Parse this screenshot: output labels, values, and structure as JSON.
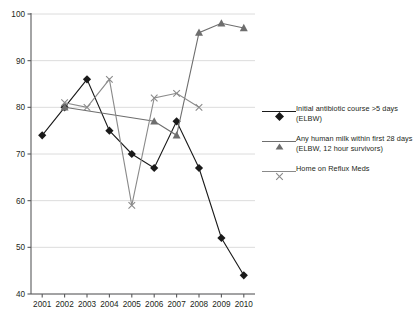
{
  "chart_data": {
    "type": "line",
    "title": "",
    "xlabel": "",
    "ylabel": "",
    "x": [
      2001,
      2002,
      2003,
      2004,
      2005,
      2006,
      2007,
      2008,
      2009,
      2010
    ],
    "xtick_labels": [
      "2001",
      "2002",
      "2003",
      "2004",
      "2005",
      "2006",
      "2007",
      "2008",
      "2009",
      "2010"
    ],
    "xlim": [
      2000.5,
      2010.5
    ],
    "ylim": [
      40,
      100
    ],
    "ytick_labels": [
      "40",
      "50",
      "60",
      "70",
      "80",
      "90",
      "100"
    ],
    "yticks": [
      40,
      50,
      60,
      70,
      80,
      90,
      100
    ],
    "grid": "horizontal",
    "legend_position": "right",
    "series": [
      {
        "name": "Initial antibiotic course >5 days (ELBW)",
        "marker": "diamond",
        "color": "#1a1a1a",
        "x": [
          2001,
          2002,
          2003,
          2004,
          2005,
          2006,
          2007,
          2008,
          2009,
          2010
        ],
        "values": [
          74,
          80,
          86,
          75,
          70,
          67,
          77,
          67,
          52,
          44
        ]
      },
      {
        "name": "Any human milk within first 28 days (ELBW, 12 hour survivors)",
        "marker": "triangle",
        "color": "#6e6e6e",
        "x": [
          2002,
          2006,
          2007,
          2008,
          2009,
          2010
        ],
        "values": [
          80,
          77,
          74,
          96,
          98,
          97
        ]
      },
      {
        "name": "Home on Reflux Meds",
        "marker": "x",
        "color": "#8a8a8a",
        "x": [
          2002,
          2003,
          2004,
          2005,
          2006,
          2007,
          2008
        ],
        "values": [
          81,
          80,
          86,
          59,
          82,
          83,
          80
        ]
      }
    ]
  },
  "legend": {
    "items": [
      {
        "label": "Initial antibiotic course >5 days (ELBW)",
        "marker": "diamond-marker-icon"
      },
      {
        "label": "Any human milk within first 28 days (ELBW, 12 hour survivors)",
        "marker": "triangle-marker-icon"
      },
      {
        "label": "Home on Reflux Meds",
        "marker": "x-marker-icon"
      }
    ]
  },
  "colors": {
    "axis": "#58595b",
    "grid": "#d8d8d8",
    "series_diamond": "#1a1a1a",
    "series_triangle": "#6e6e6e",
    "series_x": "#8a8a8a",
    "text": "#231f20"
  }
}
